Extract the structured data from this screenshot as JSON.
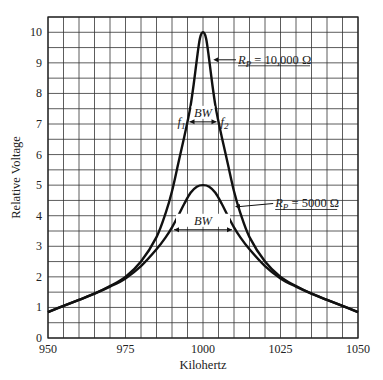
{
  "chart_data": {
    "type": "line",
    "title": "",
    "xlabel": "Kilohertz",
    "ylabel": "Relative Voltage",
    "xlim": [
      950,
      1050
    ],
    "ylim": [
      0,
      10.5
    ],
    "x_ticks": [
      950,
      975,
      1000,
      1025,
      1050
    ],
    "y_ticks": [
      0,
      1,
      2,
      3,
      4,
      5,
      6,
      7,
      8,
      9,
      10
    ],
    "grid": {
      "on": true,
      "x_step": 5,
      "y_step": 0.5
    },
    "legend": null,
    "series": [
      {
        "name": "R_P = 10,000 Ω",
        "x": [
          950,
          955,
          960,
          965,
          970,
          975,
          980,
          985,
          988,
          990,
          992,
          994,
          995,
          996,
          997,
          998,
          999,
          1000,
          1001,
          1002,
          1003,
          1004,
          1005,
          1006,
          1008,
          1010,
          1012,
          1015,
          1020,
          1025,
          1030,
          1035,
          1040,
          1045,
          1050
        ],
        "y": [
          0.85,
          1.05,
          1.25,
          1.45,
          1.7,
          2.0,
          2.5,
          3.3,
          4.1,
          4.8,
          5.7,
          6.6,
          7.07,
          7.6,
          8.3,
          9.1,
          9.8,
          10.0,
          9.8,
          9.1,
          8.3,
          7.6,
          7.07,
          6.6,
          5.7,
          4.8,
          4.1,
          3.3,
          2.5,
          2.0,
          1.7,
          1.45,
          1.25,
          1.05,
          0.85
        ]
      },
      {
        "name": "R_P = 5000 Ω",
        "x": [
          950,
          955,
          960,
          965,
          970,
          975,
          980,
          985,
          988,
          990,
          992,
          994,
          996,
          998,
          1000,
          1002,
          1004,
          1006,
          1008,
          1010,
          1012,
          1015,
          1020,
          1025,
          1030,
          1035,
          1040,
          1045,
          1050
        ],
        "y": [
          0.85,
          1.05,
          1.25,
          1.45,
          1.68,
          1.95,
          2.35,
          2.9,
          3.3,
          3.62,
          4.0,
          4.4,
          4.75,
          4.95,
          5.0,
          4.95,
          4.75,
          4.4,
          4.0,
          3.62,
          3.3,
          2.9,
          2.35,
          1.95,
          1.68,
          1.45,
          1.25,
          1.05,
          0.85
        ]
      }
    ],
    "annotations": [
      {
        "text_main": "R",
        "text_sub": "P",
        "text_rest": " = 10,000 Ω",
        "x": 1010,
        "y": 9.1,
        "pointer_to": [
          1003,
          9.1
        ]
      },
      {
        "text_main": "R",
        "text_sub": "P",
        "text_rest": " = 5000 Ω",
        "x": 1022,
        "y": 4.4,
        "pointer_to": [
          1010,
          4.3
        ]
      },
      {
        "label": "BW",
        "y": 7.07,
        "x_from": 995,
        "x_to": 1005,
        "left_label": "f",
        "left_sub": "1",
        "right_label": "f",
        "right_sub": "2"
      },
      {
        "label": "BW",
        "y": 3.54,
        "x_from": 990,
        "x_to": 1010
      }
    ]
  }
}
